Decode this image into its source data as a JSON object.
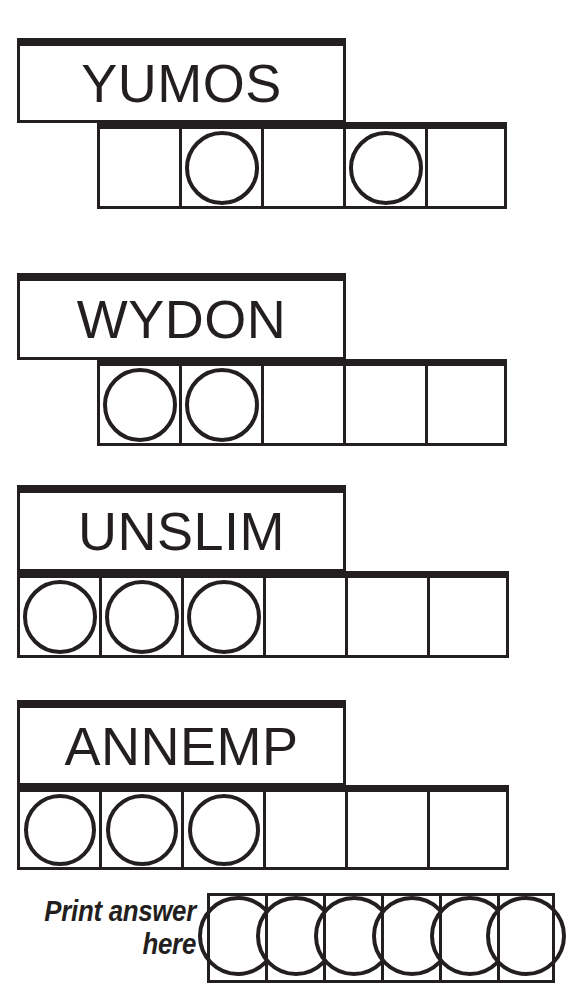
{
  "puzzle": {
    "type": "jumble-word-puzzle",
    "rows": [
      {
        "word": "YUMOS",
        "cell_count": 5,
        "circled_positions": [
          2,
          4
        ],
        "cells": [
          {
            "letter": "",
            "circled": false
          },
          {
            "letter": "",
            "circled": true
          },
          {
            "letter": "",
            "circled": false
          },
          {
            "letter": "",
            "circled": true
          },
          {
            "letter": "",
            "circled": false
          }
        ]
      },
      {
        "word": "WYDON",
        "cell_count": 5,
        "circled_positions": [
          1,
          2
        ],
        "cells": [
          {
            "letter": "",
            "circled": true
          },
          {
            "letter": "",
            "circled": true
          },
          {
            "letter": "",
            "circled": false
          },
          {
            "letter": "",
            "circled": false
          },
          {
            "letter": "",
            "circled": false
          }
        ]
      },
      {
        "word": "UNSLIM",
        "cell_count": 6,
        "circled_positions": [
          1,
          2,
          3
        ],
        "cells": [
          {
            "letter": "",
            "circled": true
          },
          {
            "letter": "",
            "circled": true
          },
          {
            "letter": "",
            "circled": true
          },
          {
            "letter": "",
            "circled": false
          },
          {
            "letter": "",
            "circled": false
          },
          {
            "letter": "",
            "circled": false
          }
        ]
      },
      {
        "word": "ANNEMP",
        "cell_count": 6,
        "circled_positions": [
          1,
          2,
          3
        ],
        "cells": [
          {
            "letter": "",
            "circled": true
          },
          {
            "letter": "",
            "circled": true
          },
          {
            "letter": "",
            "circled": true
          },
          {
            "letter": "",
            "circled": false
          },
          {
            "letter": "",
            "circled": false
          },
          {
            "letter": "",
            "circled": false
          }
        ]
      }
    ],
    "answer": {
      "label_line1": "Print answer",
      "label_line2": "here",
      "cell_count": 6,
      "cells": [
        {
          "letter": "",
          "circled": true
        },
        {
          "letter": "",
          "circled": true
        },
        {
          "letter": "",
          "circled": true
        },
        {
          "letter": "",
          "circled": true
        },
        {
          "letter": "",
          "circled": true
        },
        {
          "letter": "",
          "circled": true
        }
      ]
    }
  },
  "colors": {
    "ink": "#231f20",
    "paper": "#ffffff"
  }
}
